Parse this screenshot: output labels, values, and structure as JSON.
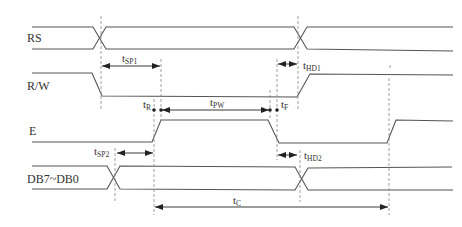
{
  "diagram": {
    "type": "timing-diagram",
    "signals": [
      {
        "name": "RS",
        "label": "RS"
      },
      {
        "name": "R/W",
        "label": "R/W"
      },
      {
        "name": "E",
        "label": "E"
      },
      {
        "name": "DB7~DB0",
        "label": "DB7~DB0"
      }
    ],
    "timings": {
      "tSP1": {
        "main": "t",
        "sub": "SP1"
      },
      "tHD1": {
        "main": "t",
        "sub": "HD1"
      },
      "tR": {
        "main": "t",
        "sub": "R"
      },
      "tPW": {
        "main": "t",
        "sub": "PW"
      },
      "tF": {
        "main": "t",
        "sub": "F"
      },
      "tSP2": {
        "main": "t",
        "sub": "SP2"
      },
      "tHD2": {
        "main": "t",
        "sub": "HD2"
      },
      "tC": {
        "main": "t",
        "sub": "C"
      }
    },
    "colors": {
      "signal": "#555555",
      "dashed": "#888888",
      "arrow": "#222222",
      "background": "#ffffff"
    }
  }
}
